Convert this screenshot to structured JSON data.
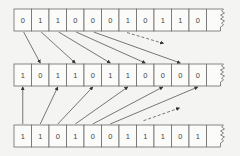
{
  "diagram": {
    "rows": [
      {
        "name": "top-register",
        "bits": [
          "0",
          "1",
          "1",
          "0",
          "0",
          "0",
          "1",
          "0",
          "1",
          "1",
          "0"
        ]
      },
      {
        "name": "middle-register",
        "bits": [
          "1",
          "0",
          "1",
          "1",
          "0",
          "1",
          "1",
          "0",
          "0",
          "0",
          "0"
        ]
      },
      {
        "name": "bottom-register",
        "bits": [
          "1",
          "1",
          "0",
          "1",
          "0",
          "0",
          "1",
          "1",
          "1",
          "0",
          "1"
        ]
      }
    ],
    "connections": [
      {
        "from_row": 0,
        "from_cell": 0,
        "to_row": 1,
        "to_cell": 1,
        "style": "solid"
      },
      {
        "from_row": 0,
        "from_cell": 1,
        "to_row": 1,
        "to_cell": 3,
        "style": "solid"
      },
      {
        "from_row": 0,
        "from_cell": 2,
        "to_row": 1,
        "to_cell": 5,
        "style": "solid"
      },
      {
        "from_row": 0,
        "from_cell": 3,
        "to_row": 1,
        "to_cell": 7,
        "style": "solid"
      },
      {
        "from_row": 0,
        "from_cell": 4,
        "to_row": 1,
        "to_cell": 9,
        "style": "solid"
      },
      {
        "from_row": 0,
        "from_cell": 5,
        "to_row": 1,
        "to_cell": 11,
        "style": "dashed"
      },
      {
        "from_row": 2,
        "from_cell": 0,
        "to_row": 1,
        "to_cell": 0,
        "style": "solid"
      },
      {
        "from_row": 2,
        "from_cell": 1,
        "to_row": 1,
        "to_cell": 2,
        "style": "solid"
      },
      {
        "from_row": 2,
        "from_cell": 2,
        "to_row": 1,
        "to_cell": 4,
        "style": "solid"
      },
      {
        "from_row": 2,
        "from_cell": 3,
        "to_row": 1,
        "to_cell": 6,
        "style": "solid"
      },
      {
        "from_row": 2,
        "from_cell": 4,
        "to_row": 1,
        "to_cell": 8,
        "style": "solid"
      },
      {
        "from_row": 2,
        "from_cell": 5,
        "to_row": 1,
        "to_cell": 10,
        "style": "solid"
      },
      {
        "from_row": 2,
        "from_cell": 6,
        "to_row": 1,
        "to_cell": 12,
        "style": "dashed"
      }
    ]
  }
}
